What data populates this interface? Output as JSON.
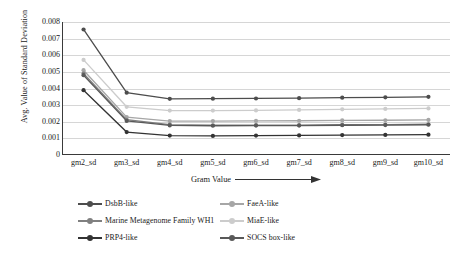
{
  "chart_data": {
    "type": "line",
    "title": "",
    "xlabel": "Gram Value",
    "ylabel": "Avg. Value of Standard Deviation",
    "categories": [
      "gm2_sd",
      "gm3_sd",
      "gm4_sd",
      "gm5_sd",
      "gm6_sd",
      "gm7_sd",
      "gm8_sd",
      "gm9_sd",
      "gm10_sd"
    ],
    "ylim": [
      0,
      0.008
    ],
    "yticks": [
      "0",
      "0.001",
      "0.002",
      "0.003",
      "0.004",
      "0.005",
      "0.006",
      "0.007",
      "0.008"
    ],
    "ytick_values": [
      0,
      0.001,
      0.002,
      0.003,
      0.004,
      0.005,
      0.006,
      0.007,
      0.008
    ],
    "grid": true,
    "legend_position": "bottom",
    "series": [
      {
        "name": "DsbB-like",
        "color": "#4d4d4d",
        "values": [
          0.00755,
          0.00375,
          0.00338,
          0.00339,
          0.0034,
          0.00342,
          0.00345,
          0.00347,
          0.0035
        ]
      },
      {
        "name": "FaeA-like",
        "color": "#a6a6a6",
        "values": [
          0.0051,
          0.00228,
          0.00204,
          0.00204,
          0.00205,
          0.00206,
          0.00208,
          0.00209,
          0.00211
        ]
      },
      {
        "name": "Marine Metagenome Family WH1",
        "color": "#808080",
        "values": [
          0.0049,
          0.00212,
          0.00183,
          0.00179,
          0.0018,
          0.0018,
          0.00182,
          0.00183,
          0.00185
        ]
      },
      {
        "name": "MiaE-like",
        "color": "#cccccc",
        "values": [
          0.00572,
          0.0029,
          0.00267,
          0.00267,
          0.00268,
          0.00271,
          0.00275,
          0.00277,
          0.0028
        ]
      },
      {
        "name": "PRP4-like",
        "color": "#333333",
        "values": [
          0.0039,
          0.00138,
          0.00117,
          0.00115,
          0.00117,
          0.00118,
          0.0012,
          0.00121,
          0.00122
        ]
      },
      {
        "name": "SOCS box-like",
        "color": "#595959",
        "values": [
          0.0048,
          0.00205,
          0.00178,
          0.00176,
          0.00177,
          0.00177,
          0.00179,
          0.0018,
          0.00182
        ]
      }
    ],
    "legend_order": [
      "DsbB-like",
      "FaeA-like",
      "Marine Metagenome Family WH1",
      "MiaE-like",
      "PRP4-like",
      "SOCS box-like"
    ]
  },
  "axis": {
    "arrow_icon": "right-arrow-icon"
  }
}
